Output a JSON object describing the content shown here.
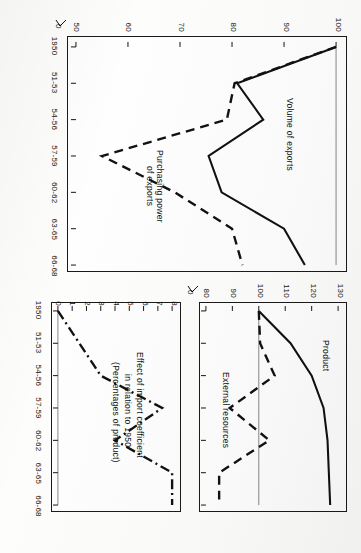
{
  "figure": {
    "orientation": "rotated-90-clockwise",
    "background": "#fdfdfc",
    "ink": "#111111"
  },
  "chart_data": [
    {
      "id": "exports",
      "type": "line",
      "title": "",
      "xlabel": "",
      "ylabel": "",
      "categories": [
        "1950",
        "51-53",
        "54-56",
        "57-59",
        "60-62",
        "63-65",
        "66-68"
      ],
      "ylim": [
        50,
        100
      ],
      "yticks": [
        50,
        60,
        70,
        80,
        90,
        100
      ],
      "axis_break": "0",
      "grid": false,
      "reference_line": 100,
      "legend": "inline-annotations",
      "series": [
        {
          "name": "Volume of exports",
          "style": "solid",
          "values": [
            100,
            81,
            86,
            75.5,
            78,
            90,
            94
          ]
        },
        {
          "name": "Purchasing power of exports",
          "style": "dashed",
          "values": [
            100,
            80.5,
            79,
            55,
            69,
            80,
            82
          ]
        }
      ]
    },
    {
      "id": "product",
      "type": "line",
      "title": "",
      "xlabel": "",
      "ylabel": "",
      "categories": [
        "1950",
        "51-53",
        "54-56",
        "57-59",
        "60-62",
        "63-65",
        "66-68"
      ],
      "ylim": [
        80,
        130
      ],
      "yticks": [
        80,
        90,
        100,
        110,
        120,
        130
      ],
      "axis_break": "0",
      "grid": false,
      "reference_line": 100,
      "legend": "inline-annotations",
      "series": [
        {
          "name": "Product",
          "style": "solid",
          "values": [
            100,
            112,
            120,
            124.5,
            126,
            126.5,
            127
          ]
        },
        {
          "name": "External resources",
          "style": "dashed",
          "values": [
            100,
            100.5,
            106,
            89,
            104,
            85,
            85
          ]
        }
      ]
    },
    {
      "id": "import-coefficient",
      "type": "line",
      "title": "",
      "xlabel": "",
      "ylabel": "",
      "categories": [
        "1950",
        "51-53",
        "54-56",
        "57-59",
        "60-62",
        "63-65",
        "66-68"
      ],
      "ylim": [
        0,
        8
      ],
      "yticks": [
        0,
        1,
        2,
        3,
        4,
        5,
        6,
        7,
        8
      ],
      "axis_break": "",
      "grid": false,
      "reference_line": 0,
      "legend": "inline-annotations",
      "series": [
        {
          "name": "Effect of import coefficient in relation to 1950 (Percentages of product)",
          "style": "dash-dot",
          "values": [
            0,
            1.5,
            3.0,
            7.3,
            4.0,
            8.0,
            8.0
          ]
        }
      ]
    }
  ],
  "panels": {
    "exports": {
      "annotations": {
        "volume": "Volume of exports",
        "purchasing_line1": "Purchasing power",
        "purchasing_line2": "of exports"
      },
      "yticks": [
        "100",
        "90",
        "80",
        "70",
        "60",
        "50"
      ],
      "break_label": "0",
      "xticks": [
        "1950",
        "51-53",
        "54-56",
        "57-59",
        "60-62",
        "63-65",
        "66-68"
      ]
    },
    "product": {
      "annotations": {
        "product": "Product",
        "external": "External resources"
      },
      "yticks": [
        "130",
        "120",
        "110",
        "100",
        "90",
        "80"
      ],
      "break_label": "0",
      "xticks": []
    },
    "coefficient": {
      "annotations": {
        "line1": "Effect of import coefficient",
        "line2": "in relation to 1950",
        "line3": "(Percentages of product)"
      },
      "yticks": [
        "8",
        "7",
        "6",
        "5",
        "4",
        "3",
        "2",
        "1",
        "0"
      ],
      "xticks": [
        "1950",
        "51-53",
        "54-56",
        "57-59",
        "60-62",
        "63-65",
        "66-68"
      ]
    }
  }
}
